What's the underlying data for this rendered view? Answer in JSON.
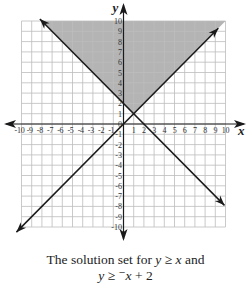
{
  "chart_data": {
    "type": "line",
    "title": "",
    "xlabel": "x",
    "ylabel": "y",
    "xlim": [
      -10,
      10
    ],
    "ylim": [
      -10,
      10
    ],
    "grid": true,
    "x_ticks": [
      -10,
      -9,
      -8,
      -7,
      -6,
      -5,
      -4,
      -3,
      -2,
      -1,
      1,
      2,
      3,
      4,
      5,
      6,
      7,
      8,
      9,
      10
    ],
    "y_ticks": [
      -10,
      -9,
      -8,
      -7,
      -6,
      -5,
      -4,
      -3,
      -2,
      -1,
      0,
      1,
      2,
      3,
      4,
      5,
      6,
      7,
      8,
      9,
      10
    ],
    "series": [
      {
        "name": "y = x",
        "equation": "y = x",
        "points": [
          [
            -10.5,
            -10.5
          ],
          [
            9.3,
            9.3
          ]
        ],
        "arrows": "both"
      },
      {
        "name": "y = -x + 2",
        "equation": "y = -x + 2",
        "points": [
          [
            -8.2,
            10.2
          ],
          [
            9.9,
            -7.9
          ]
        ],
        "arrows": "both"
      }
    ],
    "shaded_region": {
      "description": "solution set y >= x and y >= -x + 2",
      "vertices": [
        [
          1,
          1
        ],
        [
          -8,
          10
        ],
        [
          10,
          10
        ]
      ],
      "color": "#b4b4b4"
    },
    "intersection": [
      1,
      1
    ],
    "legend": null
  },
  "caption": {
    "line1_prefix": "The solution set for ",
    "line1_var1": "y",
    "line1_op": " ≥ ",
    "line1_var2": "x",
    "line1_suffix": " and",
    "line2_var1": "y",
    "line2_op": " ≥ ",
    "line2_neg": "⁻",
    "line2_var2": "x",
    "line2_suffix": " + 2"
  },
  "axis_labels": {
    "x": "x",
    "y": "y"
  },
  "colors": {
    "grid": "#bdbdbd",
    "shade": "#b4b4b4",
    "line": "#1a1a1a",
    "axis": "#1a1a1a"
  }
}
